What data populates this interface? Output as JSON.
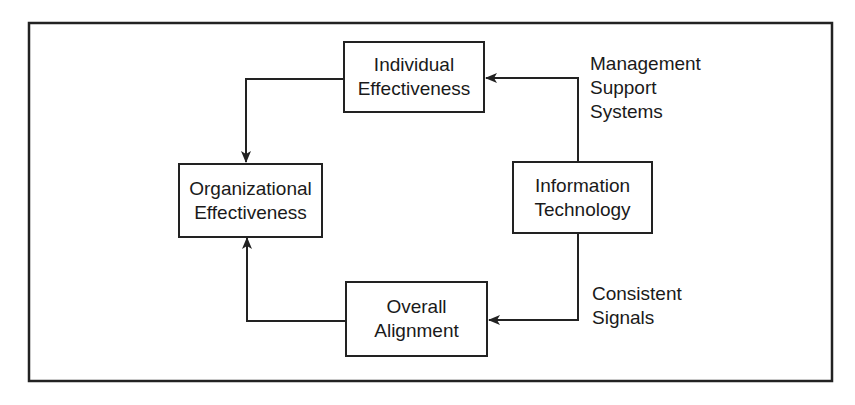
{
  "diagram": {
    "nodes": {
      "individual_effectiveness": {
        "line1": "Individual",
        "line2": "Effectiveness"
      },
      "organizational_effectiveness": {
        "line1": "Organizational",
        "line2": "Effectiveness"
      },
      "information_technology": {
        "line1": "Information",
        "line2": "Technology"
      },
      "overall_alignment": {
        "line1": "Overall",
        "line2": "Alignment"
      }
    },
    "edge_labels": {
      "management_support_systems": {
        "line1": "Management",
        "line2": "Support",
        "line3": "Systems"
      },
      "consistent_signals": {
        "line1": "Consistent",
        "line2": "Signals"
      }
    },
    "edges": [
      {
        "from": "Information Technology",
        "to": "Individual Effectiveness",
        "label": "Management Support Systems"
      },
      {
        "from": "Individual Effectiveness",
        "to": "Organizational Effectiveness"
      },
      {
        "from": "Information Technology",
        "to": "Overall Alignment",
        "label": "Consistent Signals"
      },
      {
        "from": "Overall Alignment",
        "to": "Organizational Effectiveness"
      }
    ]
  }
}
